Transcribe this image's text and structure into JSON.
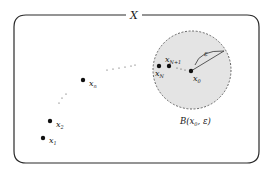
{
  "diagram": {
    "space_label": "X",
    "ball_label": "B(x₀, ε)",
    "ball_label_parts": {
      "name": "B(",
      "center": "x",
      "center_sub": "0",
      "sep": ", ",
      "radius": "ε",
      "close": ")"
    },
    "radius_label": "ε",
    "colors": {
      "frame": "#2a2a2a",
      "ball_fill": "#e4e4e4",
      "ball_border": "#555555",
      "points": "#111111"
    },
    "points": [
      {
        "id": "x1",
        "base": "x",
        "sub": "1",
        "x": 43,
        "y": 138
      },
      {
        "id": "x2",
        "base": "x",
        "sub": "2",
        "x": 50,
        "y": 121
      },
      {
        "id": "xn",
        "base": "x",
        "sub": "n",
        "x": 83,
        "y": 80
      },
      {
        "id": "xN",
        "base": "x",
        "sub": "N",
        "x": 159,
        "y": 66
      },
      {
        "id": "xN1",
        "base": "x",
        "sub": "N+1",
        "x": 169,
        "y": 66
      },
      {
        "id": "x0",
        "base": "x",
        "sub": "0",
        "x": 191,
        "y": 71
      }
    ]
  }
}
